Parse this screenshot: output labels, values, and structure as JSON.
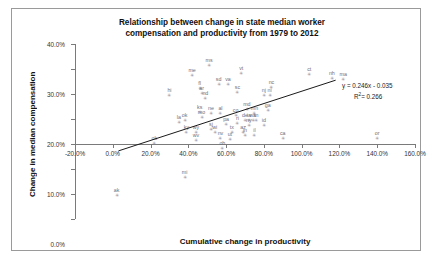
{
  "chart_data": {
    "type": "scatter",
    "title": "Relationship between change in state median worker compensation and productivity from 1979 to 2012",
    "title_line1": "Relationship between change in state median worker",
    "title_line2": "compensation and productivity from 1979 to 2012",
    "xlabel": "Cumulative change in productivity",
    "ylabel": "Change in median compensation",
    "xlim": [
      -20,
      160
    ],
    "ylim": [
      -30,
      40
    ],
    "xticks": [
      "-20.0%",
      "0.0%",
      "20.0%",
      "40.0%",
      "60.0%",
      "80.0%",
      "100.0%",
      "120.0%",
      "140.0%",
      "160.0%"
    ],
    "xtick_values": [
      -20,
      0,
      20,
      40,
      60,
      80,
      100,
      120,
      140,
      160
    ],
    "yticks": [
      "40.0%",
      "30.0%",
      "20.0%",
      "10.0%",
      "0.0%",
      "-10.0%",
      "-20.0%",
      "-30.0%"
    ],
    "ytick_values": [
      40,
      30,
      20,
      10,
      0,
      -10,
      -20,
      -30
    ],
    "grid": false,
    "legend": false,
    "marker_color": "#8f8f9c",
    "trendline": {
      "equation": "y = 0.246x - 0.035",
      "r_squared_label": "R",
      "r_squared_sup": "2",
      "r_squared_value": "= 0.266",
      "slope": 0.246,
      "intercept": -3.5,
      "x_start": 3,
      "x_end": 118,
      "color": "#1a1a1a"
    },
    "points": [
      {
        "label": "ms",
        "x": 51,
        "y": 31.5
      },
      {
        "label": "me",
        "x": 42,
        "y": 27.5
      },
      {
        "label": "vt",
        "x": 68,
        "y": 28.5
      },
      {
        "label": "ct",
        "x": 104,
        "y": 28.0
      },
      {
        "label": "nh",
        "x": 116,
        "y": 26.5
      },
      {
        "label": "ma",
        "x": 122,
        "y": 26.0
      },
      {
        "label": "sd",
        "x": 56,
        "y": 24.0
      },
      {
        "label": "va",
        "x": 61,
        "y": 24.0
      },
      {
        "label": "nc",
        "x": 84,
        "y": 23.0
      },
      {
        "label": "sc",
        "x": 66,
        "y": 21.0
      },
      {
        "label": "fl",
        "x": 46,
        "y": 22.5
      },
      {
        "label": "ar",
        "x": 47,
        "y": 20.5
      },
      {
        "label": "nd",
        "x": 49,
        "y": 18.5
      },
      {
        "label": "nj",
        "x": 80,
        "y": 19.5
      },
      {
        "label": "ni",
        "x": 83,
        "y": 19.5
      },
      {
        "label": "hi",
        "x": 30,
        "y": 19.5
      },
      {
        "label": "ks",
        "x": 46,
        "y": 13.0
      },
      {
        "label": "ne",
        "x": 52,
        "y": 12.5
      },
      {
        "label": "al",
        "x": 57,
        "y": 12.5
      },
      {
        "label": "mo",
        "x": 47,
        "y": 11.0
      },
      {
        "label": "co",
        "x": 65,
        "y": 11.5
      },
      {
        "label": "md",
        "x": 71,
        "y": 14.0
      },
      {
        "label": "mn",
        "x": 75,
        "y": 12.5
      },
      {
        "label": "ga",
        "x": 82,
        "y": 13.5
      },
      {
        "label": "de",
        "x": 70,
        "y": 9.5
      },
      {
        "label": "ia",
        "x": 72,
        "y": 9.5
      },
      {
        "label": "wa",
        "x": 74,
        "y": 9.5
      },
      {
        "label": "tn",
        "x": 76,
        "y": 9.5
      },
      {
        "label": "la",
        "x": 35,
        "y": 9.0
      },
      {
        "label": "ok",
        "x": 38,
        "y": 9.5
      },
      {
        "label": "pa",
        "x": 60,
        "y": 8.0
      },
      {
        "label": "ri",
        "x": 66,
        "y": 8.5
      },
      {
        "label": "ny",
        "x": 72,
        "y": 7.5
      },
      {
        "label": "id",
        "x": 80,
        "y": 7.5
      },
      {
        "label": "az",
        "x": 69,
        "y": 5.0
      },
      {
        "label": "tx",
        "x": 63,
        "y": 5.0
      },
      {
        "label": "sj",
        "x": 52,
        "y": 6.0
      },
      {
        "label": "ky",
        "x": 39,
        "y": 5.0
      },
      {
        "label": "wy",
        "x": 44,
        "y": 5.0
      },
      {
        "label": "wi",
        "x": 54,
        "y": 5.0
      },
      {
        "label": "in",
        "x": 70,
        "y": 3.5
      },
      {
        "label": "il",
        "x": 75,
        "y": 3.5
      },
      {
        "label": "nv",
        "x": 57,
        "y": 2.5
      },
      {
        "label": "ut",
        "x": 62,
        "y": 2.0
      },
      {
        "label": "wv",
        "x": 44,
        "y": 1.5
      },
      {
        "label": "ca",
        "x": 90,
        "y": 2.5
      },
      {
        "label": "or",
        "x": 140,
        "y": 2.5
      },
      {
        "label": "ok2",
        "x": 22,
        "y": 0.5
      },
      {
        "label": "oh",
        "x": 58,
        "y": -1.5
      },
      {
        "label": "mi",
        "x": 38,
        "y": -13.0
      },
      {
        "label": "ak",
        "x": 2,
        "y": -20.5
      }
    ]
  }
}
